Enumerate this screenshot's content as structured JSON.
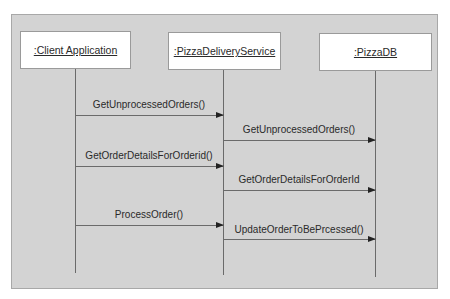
{
  "diagram": {
    "type": "UML sequence diagram",
    "colors": {
      "panel_background": "#d3d3d3",
      "panel_border": "#a8a8a8",
      "actor_box": "#ffffff",
      "line": "#6a6a6a",
      "arrowhead": "#222222",
      "text": "#2a2a2a"
    },
    "participants": [
      {
        "id": "client",
        "label": ":Client Application"
      },
      {
        "id": "service",
        "label": ":PizzaDeliveryService"
      },
      {
        "id": "db",
        "label": ":PizzaDB"
      }
    ],
    "messages": [
      {
        "from": "client",
        "to": "service",
        "label": "GetUnprocessedOrders()"
      },
      {
        "from": "service",
        "to": "db",
        "label": "GetUnprocessedOrders()"
      },
      {
        "from": "client",
        "to": "service",
        "label": "GetOrderDetailsForOrderid()"
      },
      {
        "from": "service",
        "to": "db",
        "label": "GetOrderDetailsForOrderId"
      },
      {
        "from": "client",
        "to": "service",
        "label": "ProcessOrder()"
      },
      {
        "from": "service",
        "to": "db",
        "label": "UpdateOrderToBePrcessed()"
      }
    ]
  }
}
